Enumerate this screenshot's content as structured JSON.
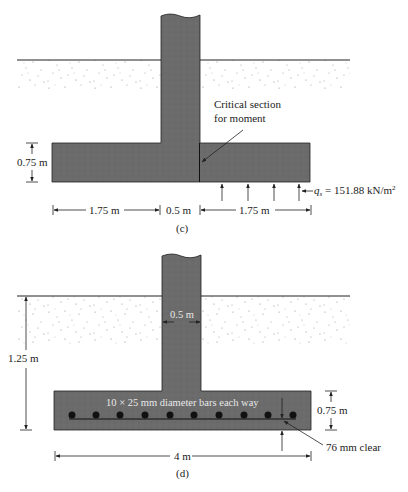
{
  "figure_c": {
    "caption": "(c)",
    "footing_thickness_label": "0.75 m",
    "left_projection_label": "1.75 m",
    "column_width_label": "0.5 m",
    "right_projection_label": "1.75 m",
    "critical_section_line1": "Critical section",
    "critical_section_line2": "for moment",
    "soil_pressure_symbol": "q",
    "soil_pressure_subscript": "s",
    "soil_pressure_value": " = 151.88 kN/m",
    "soil_pressure_exponent": "2"
  },
  "figure_d": {
    "caption": "(d)",
    "depth_label": "1.25 m",
    "column_width_label": "0.5 m",
    "reinforcement_label": "10 × 25 mm diameter bars each way",
    "footing_thickness_label": "0.75 m",
    "clear_cover_label": "76 mm clear",
    "footing_width_label": "4 m",
    "bar_count": 10
  },
  "colors": {
    "concrete": "#6b6b6b",
    "line": "#222222",
    "soil_dots": "#8a8a8a"
  }
}
